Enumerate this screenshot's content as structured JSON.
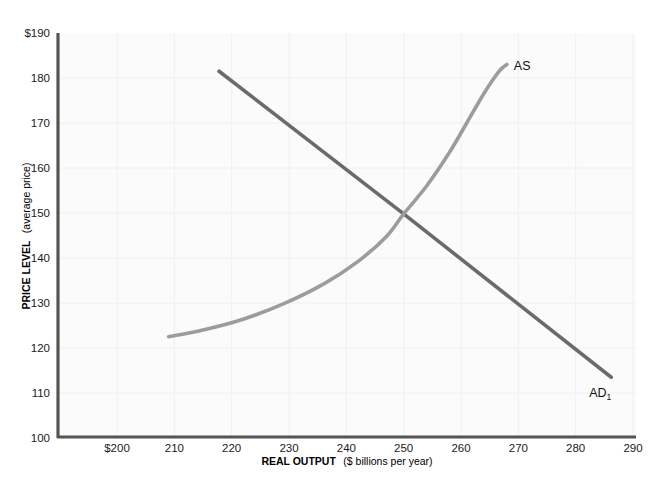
{
  "chart_data": {
    "type": "line",
    "title": "",
    "xlabel_bold": "REAL OUTPUT",
    "xlabel_rest": "($ billions per year)",
    "ylabel_bold": "PRICE LEVEL",
    "ylabel_rest": "(average price)",
    "xlim": [
      195,
      290
    ],
    "ylim": [
      100,
      190
    ],
    "xticks": [
      200,
      210,
      220,
      230,
      240,
      250,
      260,
      270,
      280,
      290
    ],
    "xtick_labels": [
      "$200",
      "210",
      "220",
      "230",
      "240",
      "250",
      "260",
      "270",
      "280",
      "290"
    ],
    "yticks": [
      100,
      110,
      120,
      130,
      140,
      150,
      160,
      170,
      180,
      190
    ],
    "ytick_labels": [
      "100",
      "110",
      "120",
      "130",
      "140",
      "150",
      "160",
      "170",
      "180",
      "$190"
    ],
    "grid": true,
    "legend_position": "inline-end-of-curve",
    "equilibrium": {
      "x": 250,
      "y": 150
    },
    "series": [
      {
        "name": "AD1",
        "label": "AD",
        "label_subscript": "1",
        "kind": "line",
        "color": "#6b6b6b",
        "points": [
          {
            "x": 217.8,
            "y": 181.5
          },
          {
            "x": 250.0,
            "y": 149.8
          },
          {
            "x": 286.2,
            "y": 113.5
          }
        ]
      },
      {
        "name": "AS",
        "label": "AS",
        "label_subscript": "",
        "kind": "curve",
        "color": "#9c9c9c",
        "points": [
          {
            "x": 209.0,
            "y": 122.5
          },
          {
            "x": 215.0,
            "y": 124.0
          },
          {
            "x": 222.0,
            "y": 126.4
          },
          {
            "x": 229.0,
            "y": 129.8
          },
          {
            "x": 236.0,
            "y": 134.2
          },
          {
            "x": 242.0,
            "y": 139.2
          },
          {
            "x": 247.0,
            "y": 144.8
          },
          {
            "x": 250.0,
            "y": 149.8
          },
          {
            "x": 254.0,
            "y": 156.0
          },
          {
            "x": 258.0,
            "y": 163.5
          },
          {
            "x": 261.0,
            "y": 170.0
          },
          {
            "x": 263.5,
            "y": 175.5
          },
          {
            "x": 265.5,
            "y": 179.5
          },
          {
            "x": 267.0,
            "y": 182.0
          },
          {
            "x": 268.0,
            "y": 183.0
          }
        ]
      }
    ]
  },
  "axes": {
    "axis_color": "#555555",
    "grid_color": "#f0f0f0",
    "plot_background": "#fbfbfb"
  }
}
